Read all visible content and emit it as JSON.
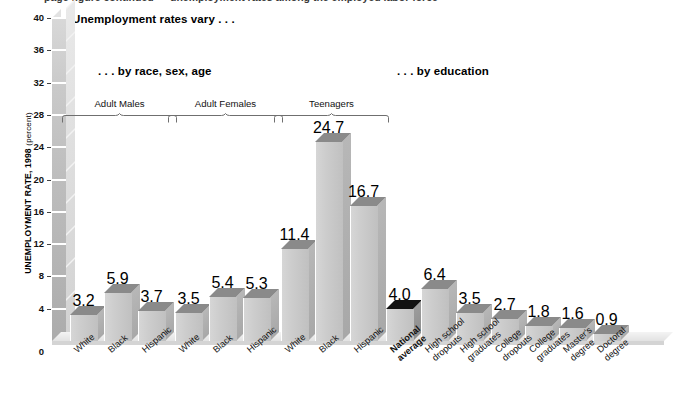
{
  "cropped_top_line": "page figure continued — unemployment rates among the employed labor force",
  "headlines": {
    "main": "Unemployment rates vary . . .",
    "by_race": ". . . by race, sex, age",
    "by_education": ". . . by education"
  },
  "y_axis_label_main": "UNEMPLOYMENT RATE, 1998",
  "y_axis_label_unit": "(percent)",
  "groups": [
    {
      "label": "Adult Males"
    },
    {
      "label": "Adult Females"
    },
    {
      "label": "Teenagers"
    }
  ],
  "chart_data": {
    "type": "bar",
    "title": "Unemployment rates vary . . .",
    "subtitles": [
      ". . . by race, sex, age",
      ". . . by education"
    ],
    "xlabel": "",
    "ylabel": "UNEMPLOYMENT RATE, 1998 (percent)",
    "ylim": [
      0,
      40
    ],
    "yticks": [
      0,
      4,
      8,
      12,
      16,
      20,
      24,
      28,
      32,
      36,
      40
    ],
    "grid": false,
    "legend": "none",
    "categories": [
      "White",
      "Black",
      "Hispanic",
      "White",
      "Black",
      "Hispanic",
      "White",
      "Black",
      "Hispanic",
      "National average",
      "High school dropouts",
      "High school graduates",
      "College dropouts",
      "College graduates",
      "Master's degree",
      "Doctoral degree"
    ],
    "category_lines": [
      [
        "White"
      ],
      [
        "Black"
      ],
      [
        "Hispanic"
      ],
      [
        "White"
      ],
      [
        "Black"
      ],
      [
        "Hispanic"
      ],
      [
        "White"
      ],
      [
        "Black"
      ],
      [
        "Hispanic"
      ],
      [
        "National",
        "average"
      ],
      [
        "High school",
        "dropouts"
      ],
      [
        "High school",
        "graduates"
      ],
      [
        "College",
        "dropouts"
      ],
      [
        "College",
        "graduates"
      ],
      [
        "Master's",
        "degree"
      ],
      [
        "Doctoral",
        "degree"
      ]
    ],
    "values": [
      3.2,
      5.9,
      3.7,
      3.5,
      5.4,
      5.3,
      11.4,
      24.7,
      16.7,
      4.0,
      6.4,
      3.5,
      2.7,
      1.8,
      1.6,
      0.9
    ],
    "value_labels": [
      "3.2",
      "5.9",
      "3.7",
      "3.5",
      "5.4",
      "5.3",
      "11.4",
      "24.7",
      "16.7",
      "4.0",
      "6.4",
      "3.5",
      "2.7",
      "1.8",
      "1.6",
      "0.9"
    ],
    "highlighted": [
      "National average"
    ],
    "group_brackets": [
      {
        "label": "Adult Males",
        "categories": [
          "White",
          "Black",
          "Hispanic"
        ]
      },
      {
        "label": "Adult Females",
        "categories": [
          "White",
          "Black",
          "Hispanic"
        ]
      },
      {
        "label": "Teenagers",
        "categories": [
          "White",
          "Black",
          "Hispanic"
        ]
      }
    ]
  },
  "colors": {
    "bar_front": "#cdcdcd",
    "bar_top": "#8a8a8a",
    "bar_top_highlight": "#121212",
    "axis_column": "#bdbdbd",
    "text": "#111111"
  }
}
